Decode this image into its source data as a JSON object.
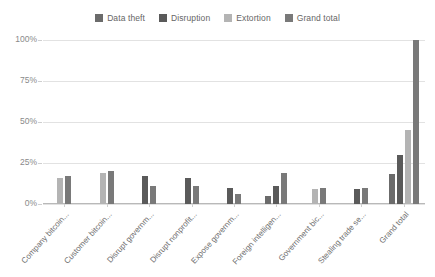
{
  "chart_data": {
    "type": "bar",
    "title": "",
    "subtitle": "",
    "xlabel": "",
    "ylabel": "",
    "ylim": [
      0,
      100
    ],
    "y_unit": "%",
    "grid": true,
    "legend_position": "top-center",
    "y_ticks": [
      "0%",
      "25%",
      "50%",
      "75%",
      "100%"
    ],
    "y_tick_values": [
      0,
      25,
      50,
      75,
      100
    ],
    "categories": [
      "Company bitcoin...",
      "Customer bitcoin...",
      "Disrupt governm...",
      "Disrupt nonprofit...",
      "Expose governm...",
      "Foreign intelligen...",
      "Government bic...",
      "Stealing trade se...",
      "Grand total"
    ],
    "series": [
      {
        "name": "Data theft",
        "color": "#6b6b6b",
        "values": [
          null,
          null,
          null,
          null,
          null,
          5,
          null,
          null,
          18
        ]
      },
      {
        "name": "Disruption",
        "color": "#5a5a5a",
        "values": [
          null,
          null,
          17,
          16,
          10,
          11,
          null,
          9,
          30
        ]
      },
      {
        "name": "Extortion",
        "color": "#b4b4b4",
        "values": [
          16,
          19,
          null,
          null,
          null,
          null,
          9,
          null,
          45
        ]
      },
      {
        "name": "Grand total",
        "color": "#797979",
        "values": [
          17,
          20,
          11,
          11,
          6,
          19,
          10,
          10,
          100
        ]
      }
    ]
  },
  "legend": {
    "items": [
      {
        "label": "Data theft",
        "color": "#6b6b6b"
      },
      {
        "label": "Disruption",
        "color": "#5a5a5a"
      },
      {
        "label": "Extortion",
        "color": "#b4b4b4"
      },
      {
        "label": "Grand total",
        "color": "#797979"
      }
    ]
  }
}
